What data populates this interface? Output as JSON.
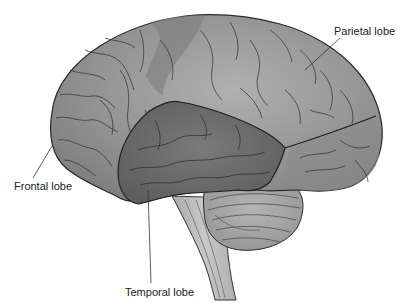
{
  "diagram": {
    "labels": {
      "parietal": "Parietal lobe",
      "frontal": "Frontal lobe",
      "temporal": "Temporal lobe"
    },
    "structures": [
      "cerebrum",
      "frontal lobe",
      "parietal lobe",
      "temporal lobe",
      "occipital region",
      "cerebellum",
      "brainstem"
    ],
    "colors": {
      "background": "#ffffff",
      "cortex": "#8f8f8f",
      "cortex_light": "#a8a8a8",
      "temporal": "#6a6a6a",
      "cerebellum": "#a0a0a0",
      "brainstem": "#bdbdbd",
      "outline": "#2a2a2a",
      "label_text": "#222222"
    }
  }
}
